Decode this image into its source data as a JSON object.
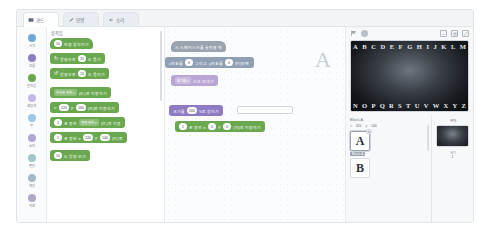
{
  "tabs": [
    {
      "label": "코드",
      "icon": "code-icon",
      "active": true
    },
    {
      "label": "모양",
      "icon": "brush-icon",
      "active": false
    },
    {
      "label": "소리",
      "icon": "speaker-icon",
      "active": false
    }
  ],
  "categories": [
    {
      "label": "시작",
      "color": "#6fa8dc"
    },
    {
      "label": "흐름",
      "color": "#8e7cc3"
    },
    {
      "label": "움직임",
      "color": "#6aa84f"
    },
    {
      "label": "생김새",
      "color": "#c5b8e8"
    },
    {
      "label": "붓",
      "color": "#9fc5e8"
    },
    {
      "label": "소리",
      "color": "#b4a7d6"
    },
    {
      "label": "판단",
      "color": "#a2c4c9"
    },
    {
      "label": "계산",
      "color": "#a6b8c8"
    },
    {
      "label": "자료",
      "color": "#b0a8c4"
    }
  ],
  "palette": {
    "title": "움직임",
    "blocks": [
      {
        "text_before": "",
        "value": "10",
        "text_after": "만큼 움직이기",
        "color": "#6aa84f",
        "kind": "normal"
      },
      {
        "text_before": "방향으로",
        "value": "15",
        "text_after": "도 돌기",
        "color": "#6aa84f",
        "kind": "rotate-cw"
      },
      {
        "text_before": "방향으로",
        "value": "15",
        "text_after": "도 돌리기",
        "color": "#6aa84f",
        "kind": "rotate-ccw"
      },
      {
        "text_before": "",
        "dropdown": "무작위 위치",
        "text_after": "(으)로 이동하기",
        "color": "#6aa84f",
        "kind": "dropdown"
      },
      {
        "text_before": "x:",
        "value": "220",
        "text_mid": "y:",
        "value2": "140",
        "text_after": "(으)로 이동하기",
        "color": "#6aa84f",
        "kind": "xy"
      },
      {
        "text_before": "",
        "value": "1",
        "text_mid": "초 동안",
        "dropdown": "현재 위치",
        "text_after": "(으)로 이동",
        "color": "#6aa84f",
        "kind": "time-drop"
      },
      {
        "text_before": "",
        "value": "1",
        "text_mid": "초 동안 x:",
        "value2": "220",
        "text_mid2": "y:",
        "value3": "140",
        "text_after": "(으)로",
        "color": "#6aa84f",
        "kind": "time-xy"
      },
      {
        "text_before": "",
        "value": "10",
        "text_after": "도 방향 보기",
        "color": "#6aa84f",
        "kind": "normal"
      }
    ]
  },
  "workspace": {
    "blocks": [
      {
        "text": "시 스페이스키를 눌렀을 때",
        "color": "#9aa4b0",
        "kind": "hat",
        "x": 6,
        "y": 14,
        "w": 74
      },
      {
        "text_before": "x좌표를",
        "value": "6",
        "text_mid": "그리고",
        "text_mid2": "y좌표를",
        "value2": "0",
        "text_after": "(이)라면",
        "color": "#8fa0b4",
        "kind": "compare",
        "x": 0,
        "y": 30,
        "w": 128
      },
      {
        "text_before": "초기화",
        "dropdown": "신호 보내기",
        "color": "#b9a6d6",
        "kind": "signal",
        "x": 6,
        "y": 48,
        "w": 62
      },
      {
        "text_before": "크기를",
        "value": "200",
        "text_after": "%로 정하기",
        "color": "#8e7cc3",
        "kind": "size",
        "x": 4,
        "y": 78,
        "w": 58,
        "has_field": true
      },
      {
        "text_before": "",
        "value": "1",
        "text_mid": "초 동안 x:",
        "value2": "0",
        "text_mid2": "y:",
        "value3": "0",
        "text_after": "(으)로 이동하기",
        "color": "#6aa84f",
        "kind": "move",
        "x": 10,
        "y": 94,
        "w": 104
      }
    ],
    "watermark": "A"
  },
  "stage": {
    "flag_icon": "green-flag-icon",
    "stop_icon": "stop-icon",
    "controls": [
      "fullscreen-width-icon",
      "grid-icon",
      "expand-icon"
    ],
    "letters_top": [
      "A",
      "B",
      "C",
      "D",
      "E",
      "F",
      "G",
      "H",
      "I",
      "J",
      "K",
      "L",
      "M"
    ],
    "letters_bottom": [
      "N",
      "O",
      "P",
      "Q",
      "R",
      "S",
      "T",
      "U",
      "V",
      "W",
      "X",
      "Y",
      "Z"
    ]
  },
  "objects": {
    "header": "Block-A",
    "coord_x_label": "x",
    "coord_x_value": "220",
    "coord_y_label": "y",
    "coord_y_value": "140",
    "items": [
      {
        "letter": "A",
        "name": "Block-A",
        "selected": true,
        "badge": "x"
      },
      {
        "letter": "B",
        "name": "Block-B",
        "selected": false,
        "badge": ""
      }
    ]
  },
  "inspector": {
    "title": "무대",
    "label": "크기",
    "value": "1"
  }
}
